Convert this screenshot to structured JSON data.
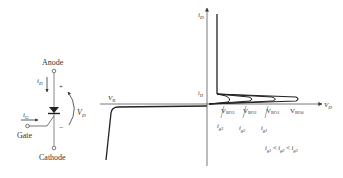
{
  "symbol": {
    "anode_label": "Anode",
    "cathode_label": "Cathode",
    "gate_label": "Gate",
    "anode_current": "i",
    "anode_current_sub": "D",
    "gate_current": "i",
    "gate_current_sub": "G",
    "voltage": "V",
    "voltage_sub": "D",
    "plus": "+",
    "minus": "−"
  },
  "characteristic": {
    "y_axis": "i",
    "y_axis_sub": "D",
    "x_axis": "V",
    "x_axis_sub": "D",
    "reverse_voltage": "V",
    "reverse_voltage_sub": "R",
    "holding_current": "i",
    "holding_current_sub": "H",
    "breakover": [
      {
        "main": "V",
        "sub": "BO3"
      },
      {
        "main": "V",
        "sub": "BO2"
      },
      {
        "main": "V",
        "sub": "BO1"
      },
      {
        "main": "V",
        "sub": "BO0"
      }
    ],
    "gate_currents": [
      {
        "main": "i",
        "sub": "g3"
      },
      {
        "main": "i",
        "sub": "g2"
      },
      {
        "main": "i",
        "sub": "g1"
      }
    ],
    "inequality": {
      "parts": [
        {
          "main": "i",
          "sub": "g1"
        },
        {
          "op": " < "
        },
        {
          "main": "i",
          "sub": "g2"
        },
        {
          "op": " < "
        },
        {
          "main": "i",
          "sub": "g3"
        }
      ]
    }
  }
}
